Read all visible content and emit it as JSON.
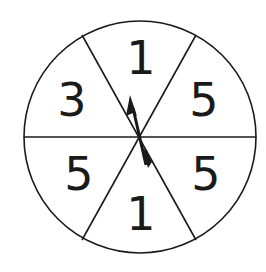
{
  "spinner": {
    "sections": [
      {
        "position": "top",
        "label": "1"
      },
      {
        "position": "upper-right",
        "label": "5"
      },
      {
        "position": "lower-right",
        "label": "5"
      },
      {
        "position": "bottom",
        "label": "1"
      },
      {
        "position": "lower-left",
        "label": "5"
      },
      {
        "position": "upper-left",
        "label": "3"
      }
    ],
    "section_count": 6,
    "arrow": "arrow-pointer"
  },
  "colors": {
    "stroke": "#1a1a1a",
    "background": "#ffffff"
  }
}
